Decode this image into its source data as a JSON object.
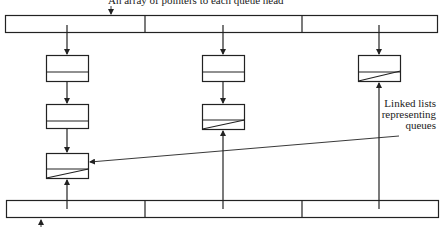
{
  "diagram": {
    "title_label": "An array of pointers to each queue head",
    "side_label": {
      "line1": "Linked lists",
      "line2": "representing",
      "line3": "queues"
    },
    "bottom_label": "",
    "head_array": {
      "cells": 3
    },
    "tail_array": {
      "cells": 3
    },
    "queues": [
      {
        "column": 1,
        "nodes": 3
      },
      {
        "column": 2,
        "nodes": 2
      },
      {
        "column": 3,
        "nodes": 1
      }
    ],
    "colors": {
      "line": "#222222",
      "background": "#ffffff"
    }
  }
}
